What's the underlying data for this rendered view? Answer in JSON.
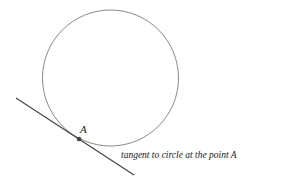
{
  "diagram": {
    "circle": {
      "cx": 110.5,
      "cy": 78,
      "r": 68,
      "stroke": "#8a8a8a"
    },
    "tangent_line": {
      "x1": 16,
      "y1": 98,
      "x2": 134,
      "y2": 175,
      "stroke": "#444444"
    },
    "point": {
      "name": "A",
      "cx": 79,
      "cy": 139,
      "fill": "#444444"
    },
    "point_label": "A",
    "caption": "tangent to circle at the point A"
  }
}
